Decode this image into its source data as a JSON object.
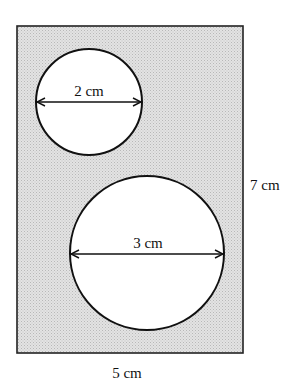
{
  "diagram": {
    "rectangle": {
      "width_label": "5 cm",
      "height_label": "7 cm",
      "fill": "#d9d9d9",
      "stroke": "#222222"
    },
    "circles": [
      {
        "id": "small",
        "diameter_label": "2 cm"
      },
      {
        "id": "large",
        "diameter_label": "3 cm"
      }
    ]
  }
}
